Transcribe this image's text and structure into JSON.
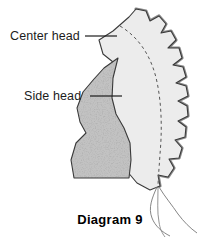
{
  "diagram": {
    "caption": "Diagram 9",
    "background_color": "#ffffff",
    "labels": [
      {
        "id": "center-head",
        "text": "Center head",
        "text_x": 10,
        "text_y": 40,
        "leader_from_x": 85,
        "leader_from_y": 36,
        "leader_to_x": 117,
        "leader_to_y": 36
      },
      {
        "id": "side-head",
        "text": "Side head",
        "text_x": 24,
        "text_y": 100,
        "leader_from_x": 90,
        "leader_from_y": 96,
        "leader_to_x": 122,
        "leader_to_y": 96
      }
    ],
    "pieces": {
      "center_head": {
        "name": "Center head",
        "fill_color": "#ececec",
        "stroke_color": "#3a3a3a",
        "outline_path": "M 99 40 L 113 31 L 129 17 L 136 9 L 146 11 L 150 21 L 159 16 L 166 24 L 161 33 L 171 31 L 176 40 L 168 48 L 179 48 L 182 58 L 173 65 L 183 67 L 186 77 L 176 83 L 186 86 L 188 96 L 178 101 L 187 106 L 188 116 L 178 121 L 186 127 L 185 137 L 175 140 L 182 148 L 179 158 L 169 159 L 174 168 L 168 177 L 158 175 L 160 186 L 150 190 L 137 183 L 126 170 L 117 152 L 111 130 L 108 107 L 109 83 L 113 62 L 103 54 Z"
      },
      "side_head": {
        "name": "Side head",
        "fill_color": "#b9b9b9",
        "texture": "speckled",
        "stroke_color": "#3a3a3a",
        "outline_path": "M 118 58 L 113 78 L 112 98 L 116 114 L 124 128 L 130 143 L 131 160 L 129 178 L 74 178 L 71 160 L 76 143 L 86 133 L 80 122 L 77 108 L 83 92 L 94 79 L 104 68 Z"
      },
      "seam_line": {
        "name": "dashed-seam-line",
        "stroke_color": "#555555",
        "dash": "3 3",
        "path": "M 120 26 C 140 38 152 58 157 82 C 162 106 162 132 160 154 C 159 170 158 180 158 188"
      },
      "notch_shadow_color": "#8a8a8a"
    },
    "threads": [
      {
        "id": "thread-1",
        "path": "M 157 187 C 152 198 148 208 152 218 C 155 226 162 232 170 236",
        "stroke_color": "#777777"
      },
      {
        "id": "thread-2",
        "path": "M 159 187 C 165 197 172 205 178 214 C 184 222 190 228 197 233",
        "stroke_color": "#777777"
      },
      {
        "id": "thread-3",
        "path": "M 158 188 C 158 200 157 212 159 222 C 160 229 162 233 165 237",
        "stroke_color": "#888888"
      }
    ],
    "caption_x": 110,
    "caption_y": 224
  }
}
